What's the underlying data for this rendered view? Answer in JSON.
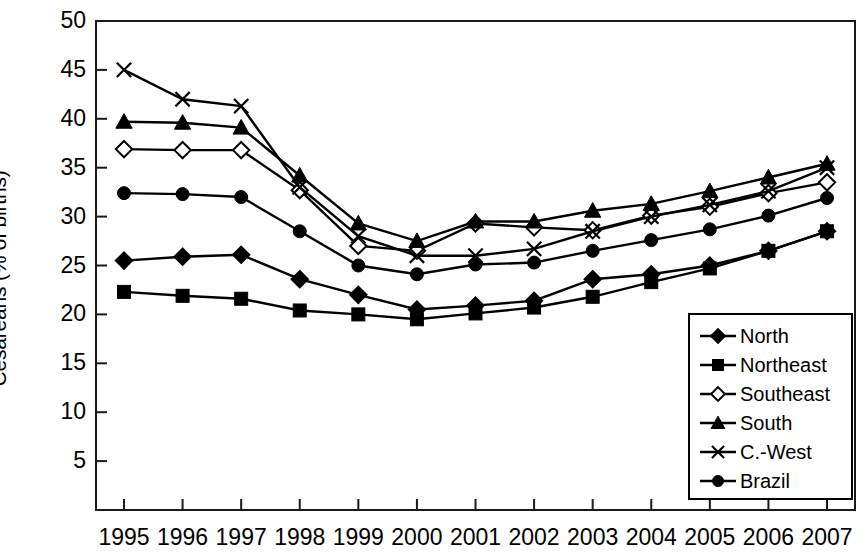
{
  "chart_data": {
    "type": "line",
    "title": "",
    "xlabel": "",
    "ylabel": "Cesareans (% of births)",
    "grid": false,
    "legend_position": "bottom-right",
    "x": [
      1995,
      1996,
      1997,
      1998,
      1999,
      2000,
      2001,
      2002,
      2003,
      2004,
      2005,
      2006,
      2007
    ],
    "categories": [
      "1995",
      "1996",
      "1997",
      "1998",
      "1999",
      "2000",
      "2001",
      "2002",
      "2003",
      "2004",
      "2005",
      "2006",
      "2007"
    ],
    "xlim": [
      1994.5,
      2007.5
    ],
    "ylim": [
      0,
      50
    ],
    "yticks": [
      5,
      10,
      15,
      20,
      25,
      30,
      35,
      40,
      45,
      50
    ],
    "ytick_labels": [
      "5",
      "10",
      "15",
      "20",
      "25",
      "30",
      "35",
      "40",
      "45",
      "50"
    ],
    "series": [
      {
        "name": "North",
        "marker": "filled-diamond",
        "values": [
          25.5,
          25.9,
          26.1,
          23.6,
          22.0,
          20.5,
          20.9,
          21.4,
          23.6,
          24.1,
          25.0,
          26.5,
          28.5
        ]
      },
      {
        "name": "Northeast",
        "marker": "filled-square",
        "values": [
          22.3,
          21.9,
          21.6,
          20.4,
          20.0,
          19.5,
          20.1,
          20.7,
          21.8,
          23.3,
          24.7,
          26.5,
          28.5
        ]
      },
      {
        "name": "Southeast",
        "marker": "open-diamond",
        "values": [
          36.9,
          36.8,
          36.8,
          32.7,
          27.0,
          26.5,
          29.3,
          28.9,
          28.6,
          30.1,
          31.0,
          32.4,
          33.5
        ]
      },
      {
        "name": "South",
        "marker": "filled-triangle",
        "values": [
          39.7,
          39.6,
          39.1,
          34.2,
          29.3,
          27.5,
          29.5,
          29.5,
          30.6,
          31.3,
          32.6,
          34.0,
          35.4
        ]
      },
      {
        "name": "C.-West",
        "marker": "cross-x",
        "values": [
          45.0,
          42.0,
          41.3,
          33.0,
          28.0,
          26.0,
          26.0,
          26.7,
          28.5,
          30.0,
          31.2,
          32.6,
          35.0
        ]
      },
      {
        "name": "Brazil",
        "marker": "filled-circle",
        "values": [
          32.4,
          32.3,
          32.0,
          28.5,
          25.0,
          24.1,
          25.1,
          25.3,
          26.5,
          27.6,
          28.7,
          30.1,
          31.9
        ]
      }
    ],
    "colors": {
      "line": "#000000",
      "background": "#ffffff",
      "axis": "#1a1a1a"
    }
  },
  "legend": {
    "items": [
      {
        "label": "North",
        "marker": "filled-diamond"
      },
      {
        "label": "Northeast",
        "marker": "filled-square"
      },
      {
        "label": "Southeast",
        "marker": "open-diamond"
      },
      {
        "label": "South",
        "marker": "filled-triangle"
      },
      {
        "label": "C.-West",
        "marker": "cross-x"
      },
      {
        "label": "Brazil",
        "marker": "filled-circle"
      }
    ]
  }
}
